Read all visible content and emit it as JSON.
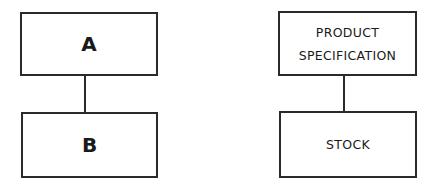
{
  "diagrams": [
    {
      "name": "generic",
      "parent": {
        "label": "A"
      },
      "child": {
        "label": "B"
      }
    },
    {
      "name": "example",
      "parent": {
        "label_lines": [
          "PRODUCT",
          "SPECIFICATION"
        ]
      },
      "child": {
        "label": "STOCK"
      }
    }
  ],
  "colors": {
    "stroke": "#2a2a2a",
    "text": "#1a1a1a",
    "background": "#ffffff"
  }
}
